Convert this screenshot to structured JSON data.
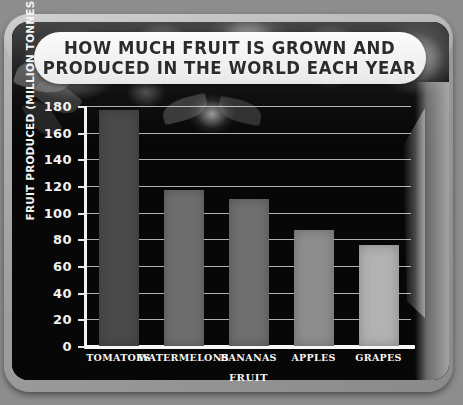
{
  "banner": {
    "title": "HOW MUCH FRUIT IS GROWN AND\nPRODUCED IN THE WORLD EACH YEAR"
  },
  "colors": {
    "panel_background": "#070707",
    "bezel": "#a6a6a6",
    "banner_background": "#f7f7f7",
    "banner_text": "#2b2b2b",
    "axis": "#f2f2f2",
    "gridline": "#ebebeb"
  },
  "chart_data": {
    "type": "bar",
    "title": "HOW MUCH FRUIT IS GROWN AND PRODUCED IN THE WORLD EACH YEAR",
    "xlabel": "FRUIT",
    "ylabel": "FRUIT PRODUCED (MILLION TONNES)",
    "categories": [
      "TOMATOES",
      "WATERMELONS",
      "BANANAS",
      "APPLES",
      "GRAPES"
    ],
    "values": [
      177,
      117,
      110,
      87,
      76
    ],
    "bar_colors": [
      "#4a4a4a",
      "#6e6e6e",
      "#6f6f6f",
      "#8d8d8d",
      "#b2b2b2"
    ],
    "ylim": [
      0,
      180
    ],
    "ytick_step": 20,
    "yticks": [
      0,
      20,
      40,
      60,
      80,
      100,
      120,
      140,
      160,
      180
    ],
    "ytick_labels": [
      "0",
      "20",
      "40",
      "60",
      "80",
      "100",
      "120",
      "140",
      "160",
      "180"
    ],
    "grid": true,
    "grid_axis": "y",
    "legend": "none"
  }
}
